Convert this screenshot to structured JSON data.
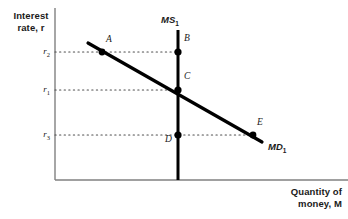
{
  "figure": {
    "type": "money-market-diagram",
    "background": "#ffffff",
    "width": 348,
    "height": 219
  },
  "axes": {
    "y_title_line1": "Interest",
    "y_title_line2": "rate, r",
    "x_title_line1": "Quantity of",
    "x_title_line2": "money, M",
    "axis_color": "#808080",
    "origin_x": 55,
    "origin_y": 180,
    "y_axis_top": 8,
    "x_axis_right": 348
  },
  "tick_labels": [
    {
      "name": "r2",
      "base": "r",
      "sub": "2",
      "y": 52
    },
    {
      "name": "r1",
      "base": "r",
      "sub": "1",
      "y": 90
    },
    {
      "name": "r3",
      "base": "r",
      "sub": "3",
      "y": 135
    }
  ],
  "curves": {
    "money_supply": {
      "label_base": "MS",
      "label_sub": "1",
      "x": 178,
      "y_top": 30,
      "y_bottom": 180,
      "color": "#000000",
      "stroke_width": 3
    },
    "money_demand": {
      "label_base": "MD",
      "label_sub": "1",
      "x1": 88,
      "y1": 43,
      "x2": 262,
      "y2": 142,
      "color": "#000000",
      "stroke_width": 3.2
    }
  },
  "points": [
    {
      "id": "A",
      "label": "A",
      "x": 102,
      "y": 52,
      "label_dx": 4,
      "label_dy": -14
    },
    {
      "id": "B",
      "label": "B",
      "x": 178,
      "y": 52,
      "label_dx": 6,
      "label_dy": -15
    },
    {
      "id": "C",
      "label": "C",
      "x": 178,
      "y": 90,
      "label_dx": 6,
      "label_dy": -15
    },
    {
      "id": "D",
      "label": "D",
      "x": 178,
      "y": 135,
      "label_dx": -13,
      "label_dy": 3
    },
    {
      "id": "E",
      "label": "E",
      "x": 253,
      "y": 135,
      "label_dx": 4,
      "label_dy": -15
    }
  ],
  "dotted_lines": [
    {
      "name": "r2-guide",
      "y": 52,
      "x1": 55,
      "x2": 182
    },
    {
      "name": "r1-guide",
      "y": 90,
      "x1": 55,
      "x2": 182
    },
    {
      "name": "r3-guide",
      "y": 135,
      "x1": 55,
      "x2": 257
    }
  ],
  "colors": {
    "curve": "#000000",
    "axis": "#808080",
    "dotted": "#4d4d4d",
    "text": "#1a1a1a"
  }
}
